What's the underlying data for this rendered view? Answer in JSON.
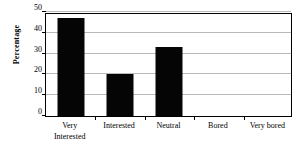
{
  "chart_data": {
    "type": "bar",
    "title": "",
    "xlabel": "",
    "ylabel": "Percentage",
    "categories": [
      "Very Interested",
      "Interested",
      "Neutral",
      "Bored",
      "Very bored"
    ],
    "category_lines": [
      [
        "Very",
        "Interested"
      ],
      [
        "Interested"
      ],
      [
        "Neutral"
      ],
      [
        "Bored"
      ],
      [
        "Very bored"
      ]
    ],
    "values": [
      47,
      20,
      33,
      0,
      0
    ],
    "ylim": [
      0,
      50
    ],
    "yticks": [
      0,
      10,
      20,
      30,
      40,
      50
    ],
    "ytick_labels": [
      "0",
      "10",
      "20",
      "30",
      "40",
      "50"
    ],
    "grid": true,
    "legend": "none",
    "bar_color": "#050505",
    "grid_color": "#b9b9b9",
    "frame_color": "#000000",
    "background_color": "#ffffff"
  }
}
